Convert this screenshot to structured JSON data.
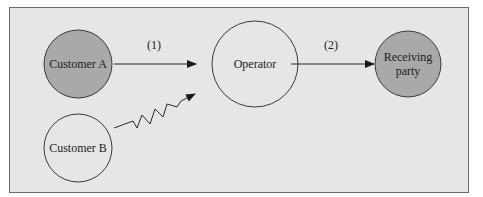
{
  "diagram": {
    "nodes": [
      {
        "id": "customer_a",
        "label": "Customer A",
        "fill": "#a9a9a9"
      },
      {
        "id": "customer_b",
        "label": "Customer B",
        "fill": "#e6e6e6"
      },
      {
        "id": "operator",
        "label": "Operator",
        "fill": "#e6e6e6"
      },
      {
        "id": "receiving_party",
        "label_line1": "Receiving",
        "label_line2": "party",
        "fill": "#a9a9a9"
      }
    ],
    "edges": [
      {
        "from": "customer_a",
        "to": "operator",
        "label": "(1)",
        "style": "straight-arrow"
      },
      {
        "from": "operator",
        "to": "receiving_party",
        "label": "(2)",
        "style": "straight-arrow"
      },
      {
        "from": "customer_b",
        "to": "operator",
        "label": "",
        "style": "zigzag-arrow"
      }
    ]
  },
  "colors": {
    "background": "#e6e6e6",
    "shaded_node": "#a9a9a9",
    "stroke": "#3a3a3a"
  }
}
